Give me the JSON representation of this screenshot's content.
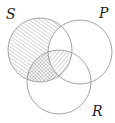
{
  "diagram": {
    "type": "venn",
    "colors": {
      "stroke": "#9a9a9a",
      "hatch": "#8a8a8a",
      "label": "#222222",
      "background": "#ffffff"
    },
    "sets": [
      {
        "id": "S",
        "label": "S",
        "cx": 40,
        "cy": 50,
        "r": 32,
        "label_x": 6,
        "label_y": 19
      },
      {
        "id": "P",
        "label": "P",
        "cx": 80,
        "cy": 52,
        "r": 32,
        "label_x": 99,
        "label_y": 18
      },
      {
        "id": "R",
        "label": "R",
        "cx": 59,
        "cy": 82,
        "r": 32,
        "label_x": 92,
        "label_y": 116
      }
    ],
    "shading": [
      {
        "region": "S only (not P, not R)",
        "pattern": "diagonal-forward"
      },
      {
        "region": "S and R, not P",
        "pattern": "crosshatch"
      },
      {
        "region": "S and P and R",
        "pattern": "diagonal-backward"
      }
    ]
  }
}
